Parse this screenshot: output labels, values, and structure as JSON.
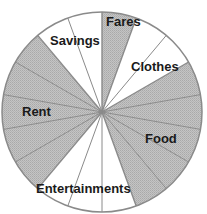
{
  "chart_data": {
    "type": "pie",
    "title": "",
    "unit": "sectors of 20 degrees (18 equal sectors total)",
    "start_angle_deg": 0,
    "direction": "clockwise",
    "slices": [
      {
        "label": "Fares",
        "value": 1,
        "shaded": true
      },
      {
        "label": "Clothes",
        "value": 2,
        "shaded": false
      },
      {
        "label": "Food",
        "value": 5,
        "shaded": true
      },
      {
        "label": "Entertainments",
        "value": 3,
        "shaded": false
      },
      {
        "label": "Rent",
        "value": 5,
        "shaded": true
      },
      {
        "label": "Savings",
        "value": 2,
        "shaded": false
      }
    ],
    "total": 18,
    "legend": "none (labels on slices)"
  },
  "colors": {
    "shaded": "#bdbdbd",
    "unshaded": "#ffffff",
    "lines": "#8a8a8a",
    "text": "#1a1a1a"
  },
  "labels": {
    "fares": "Fares",
    "clothes": "Clothes",
    "food": "Food",
    "entertainments": "Entertainments",
    "rent": "Rent",
    "savings": "Savings"
  }
}
